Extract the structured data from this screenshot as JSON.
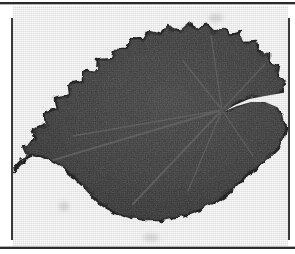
{
  "figure": {
    "kind": "scanned-botanical-plate",
    "leaf_shape": "cordate",
    "margin_type": "serrate",
    "venation": "palmate",
    "colors": {
      "paper": "#fbfbfb",
      "page_background": "#ffffff",
      "leaf_fill": "#3a3a3a",
      "leaf_fill_dark": "#2e2e2e",
      "leaf_edge": "#262626",
      "vein": "#6e6e6e",
      "rule": "#2b2b2b",
      "frame": "#3a3a3a"
    },
    "rules": {
      "top_rule": "horizontal rule",
      "bottom_rule": "horizontal rule",
      "left_rule": "vertical rule",
      "right_rule": "vertical rule"
    },
    "geometry": {
      "canvas_width": 295,
      "canvas_height": 254,
      "plate_left": 13,
      "plate_top": 6,
      "plate_width": 275,
      "plate_height": 240,
      "vein_origin_x": 209,
      "vein_origin_y": 104,
      "leaf_tip_x": 0,
      "leaf_tip_y": 166,
      "sinus_depth": 42
    },
    "leaf_outline": "M 0,166 L 14,150 L 10,141 L 24,133 L 20,124 L 34,118 L 31,108 L 45,103 L 43,93 L 57,89 L 56,79 L 70,76 L 70,66 L 84,64 L 85,54 L 99,53 L 101,43 L 114,43 L 118,33 L 131,34 L 136,25 L 148,28 L 155,20 L 166,25 L 174,18 L 184,24 L 193,18 L 201,26 L 211,21 L 217,30 L 228,27 L 232,37 L 243,36 L 245,46 L 256,47 L 256,57 L 266,60 L 264,70 L 273,75 L 269,84 L 262,90 L 250,92 L 239,91 L 228,94 L 219,99 L 213,104 L 222,100 L 233,95 L 245,93 L 256,95 L 264,101 L 270,110 L 272,121 L 270,132 L 264,142 L 256,151 L 246,159 L 236,166 L 228,174 L 220,182 L 210,190 L 199,197 L 187,203 L 174,208 L 160,212 L 146,214 L 132,214 L 119,212 L 107,208 L 96,202 L 86,195 L 77,187 L 69,178 L 61,170 L 53,163 L 44,157 L 35,152 L 26,149 L 17,148 Z",
    "veins": [
      "M 209,104 L 0,166",
      "M 209,104 L 120,198",
      "M 209,104 L 170,55",
      "M 209,104 L 198,30",
      "M 209,104 L 252,58",
      "M 209,104 L 60,130",
      "M 209,104 L 175,185",
      "M 209,104 L 240,150"
    ]
  }
}
